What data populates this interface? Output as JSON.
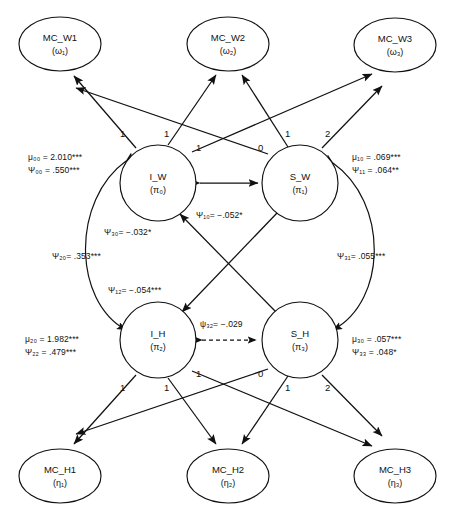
{
  "diagram": {
    "type": "sem-path-diagram",
    "observed_nodes": [
      {
        "id": "mc_w1",
        "label": "MC_W1",
        "sub": "(ω₁)",
        "cx": 60,
        "cy": 44,
        "rx": 41,
        "ry": 27
      },
      {
        "id": "mc_w2",
        "label": "MC_W2",
        "sub": "(ω₂)",
        "cx": 228,
        "cy": 44,
        "rx": 41,
        "ry": 27
      },
      {
        "id": "mc_w3",
        "label": "MC_W3",
        "sub": "(ω₃)",
        "cx": 395,
        "cy": 45,
        "rx": 41,
        "ry": 27
      },
      {
        "id": "mc_h1",
        "label": "MC_H1",
        "sub": "(η₁)",
        "cx": 60,
        "cy": 476,
        "rx": 41,
        "ry": 27
      },
      {
        "id": "mc_h2",
        "label": "MC_H2",
        "sub": "(η₂)",
        "cx": 228,
        "cy": 476,
        "rx": 41,
        "ry": 27
      },
      {
        "id": "mc_h3",
        "label": "MC_H3",
        "sub": "(η₃)",
        "cx": 395,
        "cy": 476,
        "rx": 41,
        "ry": 27
      }
    ],
    "latent_nodes": [
      {
        "id": "i_w",
        "label": "I_W",
        "sub": "(π₀)",
        "cx": 158,
        "cy": 183,
        "r": 38
      },
      {
        "id": "s_w",
        "label": "S_W",
        "sub": "(π₁)",
        "cx": 300,
        "cy": 183,
        "r": 38
      },
      {
        "id": "i_h",
        "label": "I_H",
        "sub": "(π₂)",
        "cx": 158,
        "cy": 340,
        "r": 38
      },
      {
        "id": "s_h",
        "label": "S_H",
        "sub": "(π₃)",
        "cx": 300,
        "cy": 340,
        "r": 38
      }
    ],
    "loadings_top": [
      {
        "id": "lw-i1",
        "value": "1",
        "x": 120,
        "y": 128
      },
      {
        "id": "lw-i2",
        "value": "1",
        "x": 164,
        "y": 128
      },
      {
        "id": "lw-i3",
        "value": "1",
        "x": 196,
        "y": 142
      },
      {
        "id": "lw-s1",
        "value": "0",
        "x": 258,
        "y": 142
      },
      {
        "id": "lw-s2",
        "value": "1",
        "x": 285,
        "y": 128
      },
      {
        "id": "lw-s3",
        "value": "2",
        "x": 325,
        "y": 128
      }
    ],
    "loadings_bottom": [
      {
        "id": "lh-i1",
        "value": "1",
        "x": 120,
        "y": 382
      },
      {
        "id": "lh-i2",
        "value": "1",
        "x": 164,
        "y": 382
      },
      {
        "id": "lh-i3",
        "value": "1",
        "x": 196,
        "y": 368
      },
      {
        "id": "lh-s1",
        "value": "0",
        "x": 258,
        "y": 368
      },
      {
        "id": "lh-s2",
        "value": "1",
        "x": 285,
        "y": 382
      },
      {
        "id": "lh-s3",
        "value": "2",
        "x": 325,
        "y": 382
      }
    ],
    "param_blocks": [
      {
        "id": "block-iw",
        "x": 28,
        "y": 151,
        "lines": [
          "μ₀₀ = 2.010***",
          "Ψ₀₀ = .550***"
        ]
      },
      {
        "id": "block-sw",
        "x": 352,
        "y": 151,
        "lines": [
          "μ₁₀ = .069***",
          "Ψ₁₁ = .064**"
        ]
      },
      {
        "id": "block-ih",
        "x": 25,
        "y": 333,
        "lines": [
          "μ₂₀ = 1.982***",
          "Ψ₂₂ = .479***"
        ]
      },
      {
        "id": "block-sh",
        "x": 352,
        "y": 333,
        "lines": [
          "μ₃₀ = .057***",
          "Ψ₃₃ = .048*"
        ]
      }
    ],
    "covariance_labels": [
      {
        "id": "psi10",
        "text": "Ψ₁₀= −.052*",
        "x": 196,
        "y": 209
      },
      {
        "id": "psi30",
        "text": "Ψ₃₀= −.032*",
        "x": 104,
        "y": 226
      },
      {
        "id": "psi20",
        "text": "Ψ₂₀= .353***",
        "x": 52,
        "y": 250
      },
      {
        "id": "psi31",
        "text": "Ψ₃₁= .055***",
        "x": 337,
        "y": 250
      },
      {
        "id": "psi12",
        "text": "Ψ₁₂= −.054***",
        "x": 108,
        "y": 284
      },
      {
        "id": "psi32",
        "text": "ψ₃₂= −.029",
        "x": 200,
        "y": 318
      }
    ]
  }
}
